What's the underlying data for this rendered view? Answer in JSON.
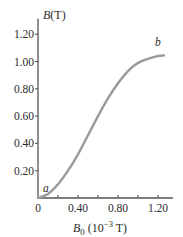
{
  "chart_data": {
    "type": "line",
    "title": "",
    "xlabel": "B0 (10^-3 T)",
    "xlabel_parts": {
      "symbol": "B",
      "sub": "0",
      "unit_prefix": " (10",
      "exp": "−3",
      "unit_suffix": " T)"
    },
    "ylabel": "B(T)",
    "ylabel_parts": {
      "symbol": "B",
      "unit": "(T)"
    },
    "xlim": [
      0,
      1.35
    ],
    "ylim": [
      0,
      1.3
    ],
    "x_ticks": [
      0,
      0.2,
      0.4,
      0.6,
      0.8,
      1.0,
      1.2
    ],
    "x_tick_labels": [
      {
        "value": 0,
        "label": "0"
      },
      {
        "value": 0.4,
        "label": "0.40"
      },
      {
        "value": 0.8,
        "label": "0.80"
      },
      {
        "value": 1.2,
        "label": "1.20"
      }
    ],
    "y_ticks": [
      0.2,
      0.4,
      0.6,
      0.8,
      1.0,
      1.2
    ],
    "y_tick_labels": [
      "0.20",
      "0.40",
      "0.60",
      "0.80",
      "1.00",
      "1.20"
    ],
    "grid": false,
    "legend": null,
    "series": [
      {
        "name": "magnetization curve",
        "color": "#9a9a9a",
        "x": [
          0,
          0.1,
          0.2,
          0.3,
          0.4,
          0.5,
          0.6,
          0.7,
          0.8,
          0.9,
          1.0,
          1.1,
          1.2,
          1.26
        ],
        "y": [
          0,
          0.03,
          0.1,
          0.2,
          0.32,
          0.46,
          0.6,
          0.73,
          0.84,
          0.93,
          0.99,
          1.02,
          1.04,
          1.045
        ]
      }
    ],
    "annotations": [
      {
        "text": "a",
        "x": 0.03,
        "y": 0.06
      },
      {
        "text": "b",
        "x": 1.2,
        "y": 1.1
      }
    ]
  }
}
